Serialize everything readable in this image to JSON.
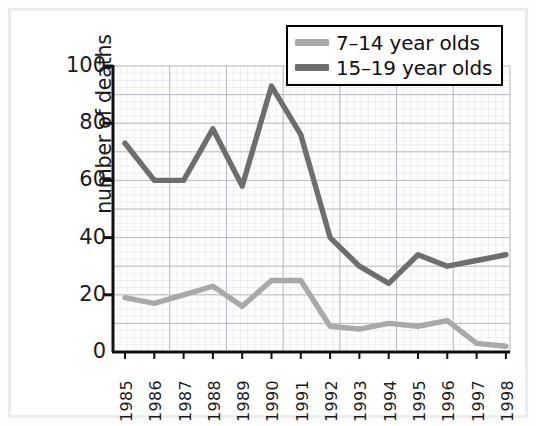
{
  "chart_data": {
    "type": "line",
    "title": "",
    "xlabel": "",
    "ylabel": "number of deaths",
    "categories": [
      "1985",
      "1986",
      "1987",
      "1988",
      "1989",
      "1990",
      "1991",
      "1992",
      "1993",
      "1994",
      "1995",
      "1996",
      "1997",
      "1998"
    ],
    "x_tick_labels": [
      "1985",
      "1986",
      "1987",
      "1988",
      "1989",
      "1990",
      "1991",
      "1992",
      "1993",
      "1994",
      "1995",
      "1996",
      "1997",
      "1998"
    ],
    "y_tick_labels": [
      "0",
      "20",
      "40",
      "60",
      "80",
      "100"
    ],
    "y_tick_values": [
      0,
      20,
      40,
      60,
      80,
      100
    ],
    "ylim": [
      0,
      100
    ],
    "grid": true,
    "legend_position": "top-right",
    "series": [
      {
        "name": "7–14 year olds",
        "color": "#a9a9a9",
        "values": [
          19,
          17,
          20,
          23,
          16,
          25,
          25,
          9,
          8,
          10,
          9,
          11,
          3,
          2
        ]
      },
      {
        "name": "15–19 year olds",
        "color": "#6e6e6e",
        "values": [
          73,
          60,
          60,
          78,
          58,
          93,
          76,
          40,
          30,
          24,
          34,
          30,
          32,
          34
        ]
      }
    ]
  },
  "legend": {
    "items": [
      {
        "label": "7–14 year olds",
        "color": "#a9a9a9"
      },
      {
        "label": "15–19 year olds",
        "color": "#6e6e6e"
      }
    ]
  },
  "axes": {
    "y_title": "number of deaths",
    "y_ticks": [
      "100",
      "80",
      "60",
      "40",
      "20",
      "0"
    ],
    "x_ticks": [
      "1985",
      "1986",
      "1987",
      "1988",
      "1989",
      "1990",
      "1991",
      "1992",
      "1993",
      "1994",
      "1995",
      "1996",
      "1997",
      "1998"
    ]
  },
  "colors": {
    "series_light": "#a9a9a9",
    "series_dark": "#6e6e6e",
    "axis": "#111111",
    "grid_major": "#b9b9c2",
    "grid_minor": "#dcdce2",
    "background": "#ffffff",
    "frame": "#ececed"
  }
}
